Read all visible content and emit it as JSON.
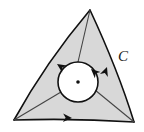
{
  "figure": {
    "type": "region-with-hole-diagram",
    "background_color": "#ffffff",
    "region": {
      "name": "curvilinear-triangle-region",
      "fill_color": "#d8d8d8",
      "stroke_color": "#111111",
      "stroke_width": 1.6,
      "vertices": [
        {
          "name": "top",
          "x": 90,
          "y": 10
        },
        {
          "name": "bottom-left",
          "x": 14,
          "y": 120
        },
        {
          "name": "bottom-right",
          "x": 134,
          "y": 122
        }
      ],
      "edges": [
        {
          "name": "left-edge",
          "from": "top",
          "to": "bottom-left",
          "curve_control": {
            "x": 46,
            "y": 62
          },
          "direction": "toward-bottom-left"
        },
        {
          "name": "bottom-edge",
          "from": "bottom-left",
          "to": "bottom-right",
          "curve_control": {
            "x": 74,
            "y": 118
          },
          "direction": "toward-bottom-right"
        },
        {
          "name": "right-edge",
          "from": "bottom-right",
          "to": "top",
          "curve_control": {
            "x": 118,
            "y": 70
          },
          "direction": "toward-top"
        }
      ]
    },
    "hole": {
      "name": "inner-circle",
      "center": {
        "x": 78,
        "y": 82
      },
      "radius": 20,
      "fill_color": "#ffffff",
      "stroke_color": "#111111",
      "stroke_width": 1.6,
      "orientation": "clockwise",
      "center_dot": {
        "radius": 1.8,
        "color": "#111111"
      }
    },
    "cuts": [
      {
        "name": "cut-to-top-vertex",
        "from": {
          "x": 78,
          "y": 62
        },
        "to": {
          "x": 90,
          "y": 10
        }
      },
      {
        "name": "cut-to-bottom-left-vertex",
        "from": {
          "x": 61,
          "y": 92
        },
        "to": {
          "x": 14,
          "y": 120
        }
      },
      {
        "name": "cut-to-bottom-right-vertex",
        "from": {
          "x": 95,
          "y": 90
        },
        "to": {
          "x": 134,
          "y": 122
        }
      }
    ],
    "arrows": [
      {
        "name": "arrow-left-edge",
        "x": 57,
        "y": 64,
        "angle": 214
      },
      {
        "name": "arrow-bottom-edge",
        "x": 72,
        "y": 118,
        "angle": 2
      },
      {
        "name": "arrow-right-edge",
        "x": 107,
        "y": 67,
        "angle": -70
      },
      {
        "name": "arrow-inner-circle",
        "x": 91,
        "y": 69,
        "angle": 222
      }
    ],
    "label": {
      "name": "curve-label-c",
      "text": "C",
      "x": 118,
      "y": 56,
      "color": "#1a1a1a",
      "style": "italic-serif"
    }
  }
}
